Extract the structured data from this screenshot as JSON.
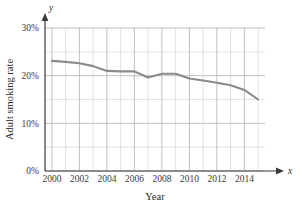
{
  "chart_data": {
    "type": "line",
    "title": "",
    "xlabel": "Year",
    "ylabel": "Adult smoking rate",
    "x_axis_variable": "x",
    "y_axis_variable": "y",
    "x": [
      2000,
      2001,
      2002,
      2003,
      2004,
      2005,
      2006,
      2007,
      2008,
      2009,
      2010,
      2011,
      2012,
      2013,
      2014,
      2015
    ],
    "values": [
      23.1,
      22.9,
      22.6,
      22.0,
      21.0,
      20.9,
      20.9,
      19.6,
      20.4,
      20.4,
      19.4,
      19.0,
      18.5,
      18.0,
      17.0,
      15.0
    ],
    "series": [
      {
        "name": "Adult smoking rate",
        "values": [
          23.1,
          22.9,
          22.6,
          22.0,
          21.0,
          20.9,
          20.9,
          19.6,
          20.4,
          20.4,
          19.4,
          19.0,
          18.5,
          18.0,
          17.0,
          15.0
        ],
        "color": "#8a8a8a"
      }
    ],
    "xlim": [
      1999.5,
      2015.5
    ],
    "ylim": [
      0,
      31
    ],
    "x_ticks": [
      2000,
      2002,
      2004,
      2006,
      2008,
      2010,
      2012,
      2014
    ],
    "x_tick_labels": [
      "2000",
      "2002",
      "2004",
      "2006",
      "2008",
      "2010",
      "2012",
      "2014"
    ],
    "x_minor_step": 1,
    "y_ticks": [
      0,
      10,
      20,
      30
    ],
    "y_tick_labels": [
      "0%",
      "10%",
      "20%",
      "30%"
    ],
    "y_minor_step": 5,
    "grid": true,
    "legend": "none",
    "grid_color": "#b9b9b9",
    "axis_color": "#3a3a3a",
    "background": "#ffffff"
  }
}
